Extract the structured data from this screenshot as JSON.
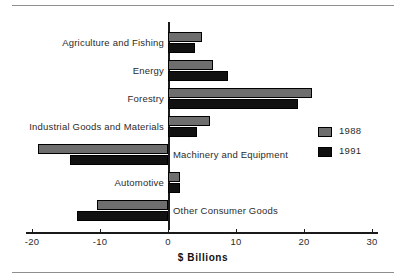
{
  "chart_data": {
    "type": "bar",
    "orientation": "horizontal",
    "title": "",
    "xlabel": "$ Billions",
    "ylabel": "",
    "xlim": [
      -22.5,
      32.5
    ],
    "xticks": [
      -20,
      -10,
      0,
      10,
      20,
      30
    ],
    "xticklabels": [
      "-20",
      "-10",
      "0",
      "10",
      "20",
      "30"
    ],
    "grid": false,
    "legend_position": "right",
    "categories": [
      "Agriculture and Fishing",
      "Energy",
      "Forestry",
      "Industrial Goods and Materials",
      "Machinery and Equipment",
      "Automotive",
      "Other Consumer Goods"
    ],
    "series": [
      {
        "name": "1988",
        "color": "#6e6e6e",
        "values": [
          5.0,
          6.6,
          21.2,
          6.2,
          -19.1,
          1.8,
          -10.4
        ]
      },
      {
        "name": "1991",
        "color": "#111111",
        "values": [
          4.0,
          8.8,
          19.1,
          4.3,
          -14.4,
          1.8,
          -13.4
        ]
      }
    ]
  },
  "legend": {
    "items": [
      {
        "label": "1988",
        "swatch": "y1988"
      },
      {
        "label": "1991",
        "swatch": "y1991"
      }
    ]
  }
}
